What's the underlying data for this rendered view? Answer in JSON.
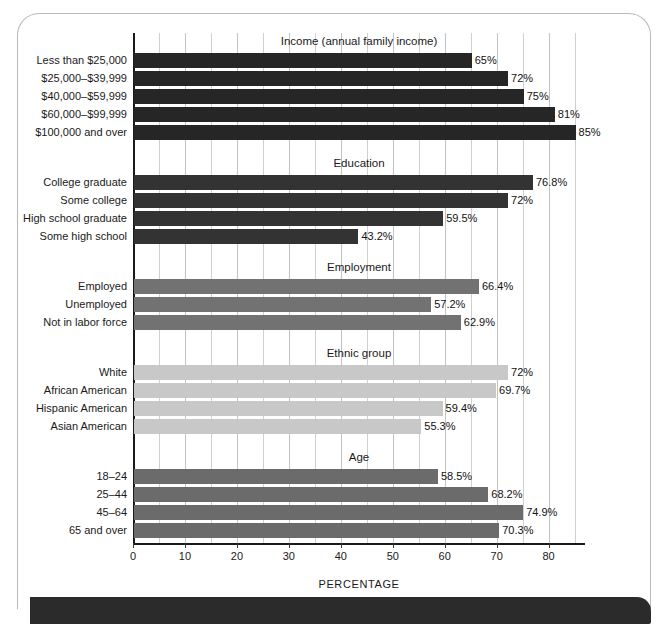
{
  "axis": {
    "title": "PERCENTAGE",
    "ticks": [
      0,
      10,
      20,
      30,
      40,
      50,
      60,
      70,
      80
    ],
    "min": 0,
    "max": 87,
    "minor_step": 5
  },
  "colors": {
    "income_bar": "#262626",
    "education_bar": "#333333",
    "employment_bar": "#727272",
    "ethnic_bar": "#c8c8c8",
    "age_bar": "#6b6b6b",
    "gridline": "#cfcfcf",
    "axis": "#1a1a1a",
    "bottom_bar": "#2b2b2b"
  },
  "chart_data": {
    "type": "bar",
    "orientation": "horizontal",
    "title": "",
    "xlabel": "PERCENTAGE",
    "ylabel": "",
    "xlim": [
      0,
      87
    ],
    "grid": true,
    "legend": "none",
    "groups": [
      {
        "name": "Income (annual family income)",
        "color": "#262626",
        "categories": [
          "Less than $25,000",
          "$25,000–$39,999",
          "$40,000–$59,999",
          "$60,000–$99,999",
          "$100,000 and over"
        ],
        "values": [
          65,
          72,
          75,
          81,
          85
        ],
        "labels": [
          "65%",
          "72%",
          "75%",
          "81%",
          "85%"
        ]
      },
      {
        "name": "Education",
        "color": "#333333",
        "categories": [
          "College graduate",
          "Some college",
          "High school graduate",
          "Some high school"
        ],
        "values": [
          76.8,
          72,
          59.5,
          43.2
        ],
        "labels": [
          "76.8%",
          "72%",
          "59.5%",
          "43.2%"
        ]
      },
      {
        "name": "Employment",
        "color": "#727272",
        "categories": [
          "Employed",
          "Unemployed",
          "Not in labor force"
        ],
        "values": [
          66.4,
          57.2,
          62.9
        ],
        "labels": [
          "66.4%",
          "57.2%",
          "62.9%"
        ]
      },
      {
        "name": "Ethnic group",
        "color": "#c8c8c8",
        "categories": [
          "White",
          "African American",
          "Hispanic American",
          "Asian American"
        ],
        "values": [
          72,
          69.7,
          59.4,
          55.3
        ],
        "labels": [
          "72%",
          "69.7%",
          "59.4%",
          "55.3%"
        ]
      },
      {
        "name": "Age",
        "color": "#6b6b6b",
        "categories": [
          "18–24",
          "25–44",
          "45–64",
          "65 and over"
        ],
        "values": [
          58.5,
          68.2,
          74.9,
          70.3
        ],
        "labels": [
          "58.5%",
          "68.2%",
          "74.9%",
          "70.3%"
        ]
      }
    ]
  }
}
